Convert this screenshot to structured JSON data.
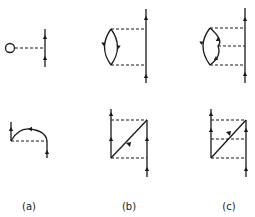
{
  "figure": {
    "type": "Feynman diagrams (Goldstone-type perturbation diagrams)",
    "columns": [
      {
        "label": "(a)",
        "top": {
          "description": "tadpole loop connected by a dashed interaction line to a directed fermion line",
          "dashed_lines": 1
        },
        "bottom": {
          "description": "exchange diagram with arc returning to a directed line, single dashed interaction",
          "dashed_lines": 1
        }
      },
      {
        "label": "(b)",
        "top": {
          "description": "particle-hole bubble connected by two dashed interactions to a directed vertical line",
          "dashed_lines": 2
        },
        "bottom": {
          "description": "two vertical directed lines with a diagonal, connected by two dashed interactions",
          "dashed_lines": 2
        }
      },
      {
        "label": "(c)",
        "top": {
          "description": "particle-hole bubble connected by three dashed interactions to a directed vertical line",
          "dashed_lines": 3
        },
        "bottom": {
          "description": "two vertical directed lines with a diagonal, connected by three dashed interactions",
          "dashed_lines": 3
        }
      }
    ],
    "colors": {
      "ink": "#1a1a1a",
      "background": "#ffffff"
    }
  }
}
